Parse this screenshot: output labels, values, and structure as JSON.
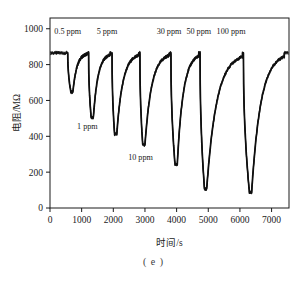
{
  "figure": {
    "caption": "( e )"
  },
  "chart_data": {
    "type": "line",
    "title": "",
    "subtitle": "",
    "xlabel": "时间/s",
    "ylabel": "电阻/MΩ",
    "xlim": [
      0,
      7550
    ],
    "ylim": [
      0,
      1060
    ],
    "xticks": [
      0,
      1000,
      2000,
      3000,
      4000,
      5000,
      6000,
      7000
    ],
    "xtick_labels": [
      "0",
      "1000",
      "2000",
      "3000",
      "4000",
      "5000",
      "6000",
      "7000"
    ],
    "yticks": [
      0,
      200,
      400,
      600,
      800,
      1000
    ],
    "ytick_labels": [
      "0",
      "200",
      "400",
      "600",
      "800",
      "1000"
    ],
    "grid": false,
    "legend": "none",
    "frame": "box",
    "line_color": "#101010",
    "baseline_resistance": 865,
    "units": {
      "x": "s",
      "y": "MΩ"
    },
    "annotations": [
      {
        "label": "0.5 ppm",
        "x": 560,
        "y": 985,
        "position": "above"
      },
      {
        "label": "1 ppm",
        "x": 1180,
        "y": 455,
        "position": "below"
      },
      {
        "label": "5 ppm",
        "x": 1800,
        "y": 985,
        "position": "above"
      },
      {
        "label": "10 ppm",
        "x": 2860,
        "y": 285,
        "position": "below"
      },
      {
        "label": "30 ppm",
        "x": 3760,
        "y": 985,
        "position": "above"
      },
      {
        "label": "50 ppm",
        "x": 4700,
        "y": 985,
        "position": "above"
      },
      {
        "label": "100 ppm",
        "x": 5720,
        "y": 985,
        "position": "above"
      }
    ],
    "series": [
      {
        "name": "resistance response",
        "pulses": [
          {
            "concentration_ppm": 0.5,
            "onset_s": 560,
            "min_s": 660,
            "min_value": 648,
            "recovery_end_s": 1180
          },
          {
            "concentration_ppm": 1,
            "onset_s": 1220,
            "min_s": 1300,
            "min_value": 505,
            "recovery_end_s": 1900
          },
          {
            "concentration_ppm": 5,
            "onset_s": 1960,
            "min_s": 2040,
            "min_value": 412,
            "recovery_end_s": 2800
          },
          {
            "concentration_ppm": 10,
            "onset_s": 2840,
            "min_s": 2930,
            "min_value": 352,
            "recovery_end_s": 3760
          },
          {
            "concentration_ppm": 30,
            "onset_s": 3820,
            "min_s": 3950,
            "min_value": 243,
            "recovery_end_s": 4700
          },
          {
            "concentration_ppm": 50,
            "onset_s": 4740,
            "min_s": 4880,
            "min_value": 105,
            "recovery_end_s": 6080
          },
          {
            "concentration_ppm": 100,
            "onset_s": 6110,
            "min_s": 6300,
            "min_value": 88,
            "recovery_end_s": 7400
          }
        ]
      }
    ]
  }
}
